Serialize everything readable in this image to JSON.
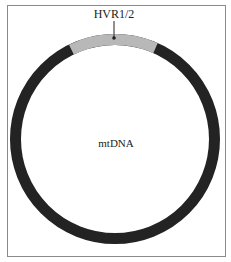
{
  "diagram": {
    "type": "circular-genome-map",
    "center_label": "mtDNA",
    "regions": [
      {
        "label": "HVR1/2",
        "color": "#b8b8b8",
        "start_deg": -26,
        "end_deg": 24
      }
    ],
    "ring_color": "#232323",
    "frame_color": "#8a8a8a"
  }
}
